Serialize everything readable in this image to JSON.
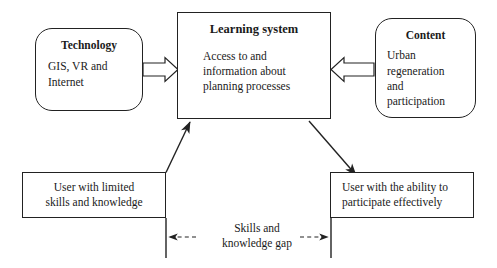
{
  "diagram": {
    "background_color": "#ffffff",
    "stroke_color": "#222222",
    "nodes": {
      "technology": {
        "title": "Technology",
        "body": "GIS, VR and\nInternet",
        "shape": "rounded-rectangle"
      },
      "learning_system": {
        "title": "Learning system",
        "body": "Access to and\ninformation about\nplanning processes",
        "shape": "rectangle"
      },
      "content": {
        "title": "Content",
        "body": "Urban\nregeneration\nand\nparticipation",
        "shape": "rounded-rectangle"
      },
      "user_limited": {
        "text": "User with limited\nskills and knowledge",
        "shape": "rectangle"
      },
      "user_able": {
        "text": "User with the ability to\nparticipate effectively",
        "shape": "rectangle"
      }
    },
    "labels": {
      "gap": "Skills and\nknowledge gap"
    },
    "connectors": [
      {
        "name": "technology-to-learning-system",
        "style": "hollow-block-arrow",
        "direction": "right"
      },
      {
        "name": "content-to-learning-system",
        "style": "hollow-block-arrow",
        "direction": "left"
      },
      {
        "name": "user-limited-to-learning-system",
        "style": "solid-line-arrow",
        "direction": "up-right"
      },
      {
        "name": "learning-system-to-user-able",
        "style": "solid-line-arrow",
        "direction": "down-right"
      },
      {
        "name": "skills-gap-double-arrow",
        "style": "dashed-double-arrow",
        "direction": "both"
      }
    ]
  }
}
